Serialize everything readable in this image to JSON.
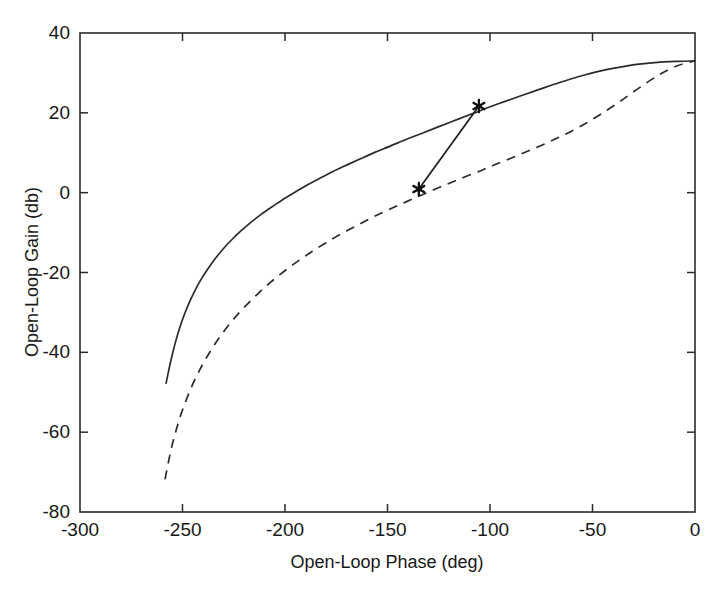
{
  "chart_data": {
    "type": "line",
    "title": "",
    "xlabel": "Open-Loop Phase (deg)",
    "ylabel": "Open-Loop Gain (db)",
    "xlim": [
      -300,
      0
    ],
    "ylim": [
      -80,
      40
    ],
    "xticks": [
      -300,
      -250,
      -200,
      -150,
      -100,
      -50,
      0
    ],
    "xticklabels": [
      "-300",
      "-250",
      "-200",
      "-150",
      "-100",
      "-50",
      "0"
    ],
    "yticks": [
      -80,
      -60,
      -40,
      -20,
      0,
      20,
      40
    ],
    "yticklabels": [
      "-80",
      "-60",
      "-40",
      "-20",
      "0",
      "20",
      "40"
    ],
    "grid": false,
    "legend": "none",
    "series": [
      {
        "name": "solid-nichols-curve",
        "style": "solid",
        "color": "#2b2b2b",
        "points": [
          [
            -258.0,
            -47.7
          ],
          [
            -256.5,
            -44.0
          ],
          [
            -255.0,
            -40.6
          ],
          [
            -253.2,
            -37.0
          ],
          [
            -251.2,
            -33.6
          ],
          [
            -249.0,
            -30.4
          ],
          [
            -246.5,
            -27.3
          ],
          [
            -243.8,
            -24.4
          ],
          [
            -240.8,
            -21.6
          ],
          [
            -237.5,
            -19.0
          ],
          [
            -234.0,
            -16.5
          ],
          [
            -230.2,
            -14.1
          ],
          [
            -226.0,
            -11.8
          ],
          [
            -221.5,
            -9.6
          ],
          [
            -216.8,
            -7.5
          ],
          [
            -211.8,
            -5.5
          ],
          [
            -206.5,
            -3.6
          ],
          [
            -201.0,
            -1.7
          ],
          [
            -195.2,
            0.1
          ],
          [
            -189.2,
            1.9
          ],
          [
            -183.0,
            3.6
          ],
          [
            -176.6,
            5.3
          ],
          [
            -170.0,
            6.9
          ],
          [
            -163.2,
            8.5
          ],
          [
            -156.2,
            10.1
          ],
          [
            -149.0,
            11.6
          ],
          [
            -141.6,
            13.2
          ],
          [
            -134.0,
            14.7
          ],
          [
            -126.2,
            16.3
          ],
          [
            -118.2,
            17.9
          ],
          [
            -110.0,
            19.5
          ],
          [
            -105.4,
            20.4
          ],
          [
            -101.6,
            21.2
          ],
          [
            -93.0,
            22.8
          ],
          [
            -84.2,
            24.4
          ],
          [
            -75.2,
            26.0
          ],
          [
            -66.0,
            27.6
          ],
          [
            -56.6,
            29.1
          ],
          [
            -47.0,
            30.4
          ],
          [
            -37.2,
            31.4
          ],
          [
            -27.2,
            32.2
          ],
          [
            -17.0,
            32.7
          ],
          [
            -8.4,
            32.9
          ],
          [
            0.0,
            33.0
          ]
        ]
      },
      {
        "name": "dashed-nichols-curve",
        "style": "dashed",
        "color": "#2b2b2b",
        "points": [
          [
            -258.5,
            -71.8
          ],
          [
            -257.0,
            -67.8
          ],
          [
            -255.4,
            -64.0
          ],
          [
            -253.6,
            -60.4
          ],
          [
            -251.6,
            -56.9
          ],
          [
            -249.4,
            -53.6
          ],
          [
            -247.0,
            -50.4
          ],
          [
            -244.4,
            -47.3
          ],
          [
            -241.6,
            -44.4
          ],
          [
            -238.6,
            -41.6
          ],
          [
            -235.4,
            -38.9
          ],
          [
            -232.0,
            -36.3
          ],
          [
            -228.4,
            -33.8
          ],
          [
            -224.6,
            -31.4
          ],
          [
            -220.6,
            -29.1
          ],
          [
            -216.4,
            -26.9
          ],
          [
            -212.0,
            -24.7
          ],
          [
            -207.4,
            -22.6
          ],
          [
            -202.6,
            -20.6
          ],
          [
            -197.6,
            -18.6
          ],
          [
            -192.4,
            -16.7
          ],
          [
            -187.0,
            -14.8
          ],
          [
            -181.4,
            -13.0
          ],
          [
            -175.6,
            -11.2
          ],
          [
            -169.6,
            -9.5
          ],
          [
            -163.4,
            -7.8
          ],
          [
            -157.0,
            -6.1
          ],
          [
            -150.4,
            -4.5
          ],
          [
            -143.6,
            -2.9
          ],
          [
            -136.6,
            -1.3
          ],
          [
            -134.7,
            -0.9
          ],
          [
            -129.4,
            0.3
          ],
          [
            -122.0,
            1.9
          ],
          [
            -114.4,
            3.5
          ],
          [
            -106.6,
            5.1
          ],
          [
            -105.4,
            5.3
          ],
          [
            -98.6,
            6.8
          ],
          [
            -90.4,
            8.5
          ],
          [
            -82.0,
            10.3
          ],
          [
            -73.4,
            12.2
          ],
          [
            -64.6,
            14.3
          ],
          [
            -55.6,
            16.7
          ],
          [
            -46.4,
            19.5
          ],
          [
            -37.0,
            22.7
          ],
          [
            -27.4,
            26.2
          ],
          [
            -17.6,
            29.5
          ],
          [
            -8.6,
            31.8
          ],
          [
            0.0,
            33.0
          ]
        ]
      },
      {
        "name": "margin-connector-line",
        "style": "solid",
        "color": "#222222",
        "points": [
          [
            -105.4,
            21.7
          ],
          [
            -134.7,
            0.9
          ]
        ]
      }
    ],
    "markers": [
      {
        "name": "gain-margin-point",
        "x": -105.4,
        "y": 21.7,
        "symbol": "star"
      },
      {
        "name": "phase-margin-point",
        "x": -134.7,
        "y": 0.9,
        "symbol": "star"
      }
    ]
  }
}
